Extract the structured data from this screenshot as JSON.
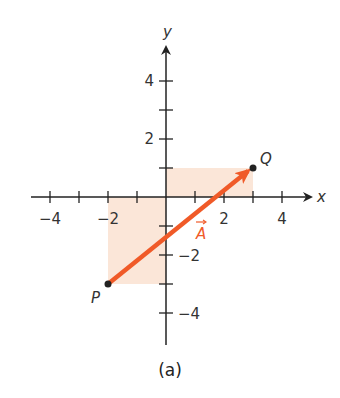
{
  "figure": {
    "caption": "(a)",
    "axes": {
      "x_label": "x",
      "y_label": "y",
      "x_ticks": [
        "−4",
        "−2",
        "2",
        "4"
      ],
      "y_ticks": [
        "4",
        "2",
        "−2",
        "−4"
      ],
      "range": [
        -4,
        4
      ]
    },
    "points": {
      "P": {
        "label": "P",
        "x": -2,
        "y": -3
      },
      "Q": {
        "label": "Q",
        "x": 3,
        "y": 1
      }
    },
    "vector": {
      "label": "A",
      "from": "P",
      "to": "Q",
      "color": "#f05a28"
    },
    "shaded_regions_color": "#fbe6d8"
  }
}
